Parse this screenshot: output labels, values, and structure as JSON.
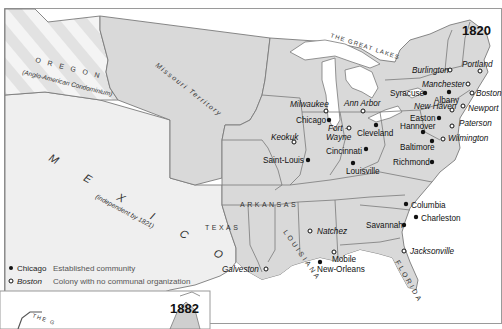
{
  "map": {
    "year_main": "1820",
    "year_inset": "1882",
    "regions": {
      "oregon": "O R E G O N",
      "oregon_sub": "(Anglo-American Condominium)",
      "missouri": "Missouri Territory",
      "mexico": "M E X I C O",
      "mexico_sub": "(independent by 1821)",
      "texas": "TEXAS",
      "arkansas": "ARKANSAS",
      "louisiana": "LOUISIANA",
      "florida": "FLORIDA",
      "great_lakes": "THE GREAT LAKES",
      "inset_lakes": "THE G"
    },
    "cities": [
      {
        "name": "Burlington",
        "type": "colony"
      },
      {
        "name": "Portland",
        "type": "colony"
      },
      {
        "name": "Manchester",
        "type": "colony"
      },
      {
        "name": "Syracuse",
        "type": "established"
      },
      {
        "name": "Albany",
        "type": "established"
      },
      {
        "name": "Boston",
        "type": "colony"
      },
      {
        "name": "New Haven",
        "type": "colony"
      },
      {
        "name": "Newport",
        "type": "colony"
      },
      {
        "name": "Milwaukee",
        "type": "colony"
      },
      {
        "name": "Ann Arbor",
        "type": "colony"
      },
      {
        "name": "Chicago",
        "type": "established"
      },
      {
        "name": "Fort - Wayne",
        "type": "colony"
      },
      {
        "name": "Cleveland",
        "type": "established"
      },
      {
        "name": "Easton",
        "type": "established"
      },
      {
        "name": "Hannover",
        "type": "established"
      },
      {
        "name": "Paterson",
        "type": "colony"
      },
      {
        "name": "Wilmington",
        "type": "colony"
      },
      {
        "name": "Keokuk",
        "type": "colony"
      },
      {
        "name": "Cincinnati",
        "type": "established"
      },
      {
        "name": "Baltimore",
        "type": "established"
      },
      {
        "name": "Saint-Louis",
        "type": "established"
      },
      {
        "name": "Richmond",
        "type": "established"
      },
      {
        "name": "Louisville",
        "type": "established"
      },
      {
        "name": "Columbia",
        "type": "established"
      },
      {
        "name": "Charleston",
        "type": "established"
      },
      {
        "name": "Savannah",
        "type": "established"
      },
      {
        "name": "Natchez",
        "type": "colony"
      },
      {
        "name": "Mobile",
        "type": "colony"
      },
      {
        "name": "Jacksonville",
        "type": "colony"
      },
      {
        "name": "Galveston",
        "type": "colony"
      },
      {
        "name": "New-Orleans",
        "type": "established"
      }
    ],
    "labels": {
      "burlington": "Burlington",
      "portland": "Portland",
      "manchester": "Manchester",
      "syracuse": "Syracuse",
      "albany": "Albany",
      "boston": "Boston",
      "newhaven": "New Haven",
      "newport": "Newport",
      "milwaukee": "Milwaukee",
      "annarbor": "Ann Arbor",
      "chicago": "Chicago",
      "fort": "Fort -",
      "wayne": "Wayne",
      "cleveland": "Cleveland",
      "easton": "Easton",
      "hannover": "Hannover",
      "paterson": "Paterson",
      "wilmington": "Wilmington",
      "keokuk": "Keokuk",
      "cincinnati": "Cincinnati",
      "baltimore": "Baltimore",
      "saintlouis": "Saint-Louis",
      "richmond": "Richmond",
      "louisville": "Louisville",
      "columbia": "Columbia",
      "charleston": "Charleston",
      "savannah": "Savannah",
      "natchez": "Natchez",
      "mobile": "Mobile",
      "jacksonville": "Jacksonville",
      "galveston": "Galveston",
      "neworleans": "New-Orleans"
    }
  },
  "legend": {
    "established": {
      "sample": "Chicago",
      "description": "Established community"
    },
    "colony": {
      "sample": "Boston",
      "description": "Colony with no communal organization"
    }
  },
  "colors": {
    "us_fill": "#d9d9d9",
    "foreign_fill": "#efefef",
    "border": "#7a7a7a",
    "marker": "#111111"
  }
}
